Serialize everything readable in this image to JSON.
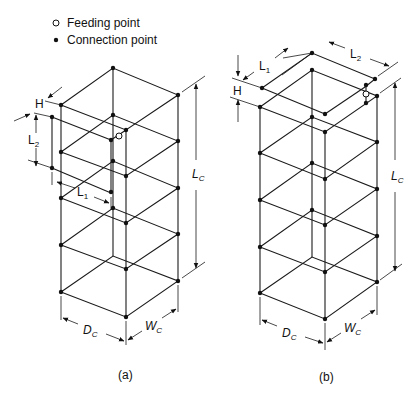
{
  "legend": {
    "items": [
      {
        "symbol": "open-circle",
        "label": "Feeding point"
      },
      {
        "symbol": "filled-dot",
        "label": "Connection point"
      }
    ]
  },
  "figure_a": {
    "caption": "(a)",
    "dims": {
      "H": "H",
      "L2": "L",
      "L2_sub": "2",
      "L1": "L",
      "L1_sub": "1",
      "Lc": "L",
      "Lc_sub": "C",
      "Dc": "D",
      "Dc_sub": "C",
      "Wc": "W",
      "Wc_sub": "C"
    }
  },
  "figure_b": {
    "caption": "(b)",
    "dims": {
      "H": "H",
      "L1": "L",
      "L1_sub": "1",
      "L2": "L",
      "L2_sub": "2",
      "Lc": "L",
      "Lc_sub": "C",
      "Dc": "D",
      "Dc_sub": "C",
      "Wc": "W",
      "Wc_sub": "C"
    }
  }
}
